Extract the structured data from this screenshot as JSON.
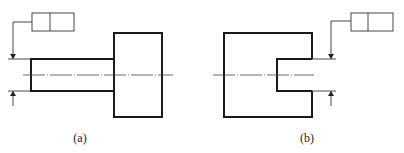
{
  "figure": {
    "type": "geometric tolerancing drawing",
    "panels": [
      {
        "id": "a",
        "caption": "(a)",
        "description": "Shaft (narrow cylinder) attached to larger block; feature control frame leader arrows point to shaft diameter dimension lines",
        "feature_control_frame": {
          "cells": 2,
          "values": [
            "",
            ""
          ]
        },
        "shapes": {
          "shaft": {
            "x": 31,
            "y": 59,
            "w": 83,
            "h": 32
          },
          "block": {
            "x": 114,
            "y": 33,
            "w": 48,
            "h": 84
          }
        }
      },
      {
        "id": "b",
        "caption": "(b)",
        "description": "Block with rectangular slot (hole) on the right; feature control frame leader arrows point to slot width dimension lines",
        "feature_control_frame": {
          "cells": 2,
          "values": [
            "",
            ""
          ]
        },
        "shapes": {
          "block": {
            "x": 224,
            "y": 33,
            "w": 88,
            "h": 84
          },
          "slot": {
            "x": 277,
            "y": 59,
            "w": 35,
            "h": 32
          }
        }
      }
    ],
    "colors": {
      "line": "#1a1a1a",
      "background": "#ffffff"
    }
  }
}
